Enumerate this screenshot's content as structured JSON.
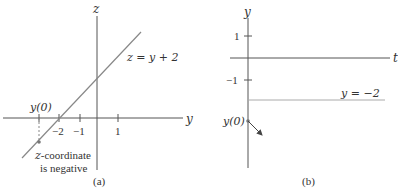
{
  "panel_a": {
    "caption": "(a)",
    "vertical_axis_label": "z",
    "horizontal_axis_label": "y",
    "ticks": [
      {
        "label": "−2",
        "value": -2
      },
      {
        "label": "−1",
        "value": -1
      },
      {
        "label": "1",
        "value": 1
      }
    ],
    "initial_point_label": "y(0)",
    "line_label": "z = y + 2",
    "annotation_line1": "z-coordinate",
    "annotation_line2": "is negative",
    "annotation_var": "z",
    "annotation_rest": "-coordinate"
  },
  "panel_b": {
    "caption": "(b)",
    "vertical_axis_label": "y",
    "horizontal_axis_label": "t",
    "ticks": [
      {
        "label": "1",
        "value": 1
      },
      {
        "label": "−1",
        "value": -1
      }
    ],
    "initial_point_label": "y(0)",
    "equilibrium_label": "y = −2"
  },
  "colors": {
    "axis": "#555555",
    "line": "#888888",
    "equilibrium": "#aaaaaa",
    "text": "#333333"
  }
}
